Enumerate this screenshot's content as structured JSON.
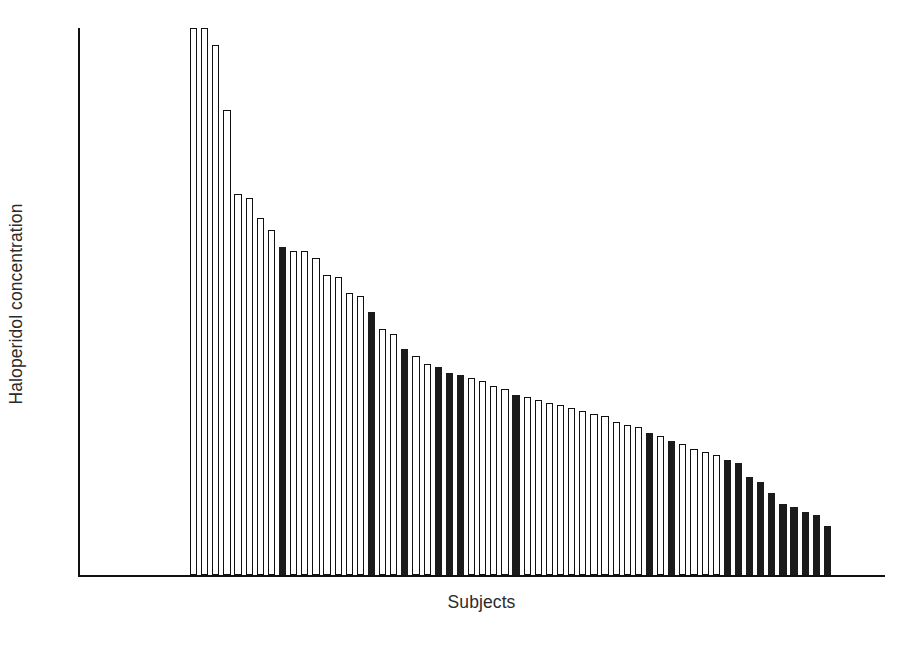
{
  "chart_data": {
    "type": "bar",
    "title": "",
    "subtitle": "",
    "xlabel": "Subjects",
    "ylabel": "Haloperidol concentration",
    "grid": false,
    "legend": null,
    "axis_ticks": {
      "x": [],
      "y": []
    },
    "note": "Bars are rank-ordered by descending haloperidol concentration; one bar per subject. Fill encodes group membership: filled (solid black) vs open (white with black outline). The y-axis has no numeric tick labels in the figure, so values are read as relative heights on a 0-100 scale of the plotted axis.",
    "ylim": [
      0,
      100
    ],
    "n_bars": 58,
    "categories": [
      "S1",
      "S2",
      "S3",
      "S4",
      "S5",
      "S6",
      "S7",
      "S8",
      "S9",
      "S10",
      "S11",
      "S12",
      "S13",
      "S14",
      "S15",
      "S16",
      "S17",
      "S18",
      "S19",
      "S20",
      "S21",
      "S22",
      "S23",
      "S24",
      "S25",
      "S26",
      "S27",
      "S28",
      "S29",
      "S30",
      "S31",
      "S32",
      "S33",
      "S34",
      "S35",
      "S36",
      "S37",
      "S38",
      "S39",
      "S40",
      "S41",
      "S42",
      "S43",
      "S44",
      "S45",
      "S46",
      "S47",
      "S48",
      "S49",
      "S50",
      "S51",
      "S52",
      "S53",
      "S54",
      "S55",
      "S56",
      "S57",
      "S58"
    ],
    "values": [
      100.0,
      100.0,
      96.9,
      85.0,
      69.6,
      69.0,
      65.2,
      63.0,
      60.0,
      59.3,
      59.3,
      58.0,
      54.8,
      54.5,
      51.5,
      51.0,
      48.0,
      45.0,
      44.0,
      41.3,
      40.0,
      38.5,
      38.0,
      37.0,
      36.5,
      36.0,
      35.5,
      34.5,
      34.0,
      33.0,
      32.5,
      32.0,
      31.5,
      31.0,
      30.5,
      30.0,
      29.5,
      29.0,
      28.0,
      27.5,
      27.0,
      26.0,
      25.5,
      24.5,
      24.0,
      23.0,
      22.5,
      22.0,
      21.0,
      20.5,
      18.0,
      17.0,
      15.0,
      13.0,
      12.5,
      11.5,
      11.0,
      9.0
    ],
    "fills": [
      "open",
      "open",
      "open",
      "open",
      "open",
      "open",
      "open",
      "open",
      "filled",
      "open",
      "open",
      "open",
      "open",
      "open",
      "open",
      "open",
      "filled",
      "open",
      "open",
      "filled",
      "open",
      "open",
      "filled",
      "filled",
      "filled",
      "open",
      "open",
      "open",
      "open",
      "filled",
      "open",
      "open",
      "open",
      "open",
      "open",
      "open",
      "open",
      "open",
      "open",
      "open",
      "open",
      "filled",
      "open",
      "filled",
      "open",
      "open",
      "open",
      "open",
      "filled",
      "filled",
      "filled",
      "filled",
      "filled",
      "filled",
      "filled",
      "filled",
      "filled",
      "filled"
    ],
    "series": [
      {
        "name": "Open bars",
        "fill": "#ffffff",
        "outline": "#111111"
      },
      {
        "name": "Filled bars",
        "fill": "#1b1b1b",
        "outline": "#1b1b1b"
      }
    ],
    "colors": {
      "axis": "#111111",
      "open_bar_fill": "#ffffff",
      "bar_outline": "#111111",
      "filled_bar_fill": "#1b1b1b",
      "background": "#ffffff",
      "text": "#2b2b2b"
    }
  }
}
